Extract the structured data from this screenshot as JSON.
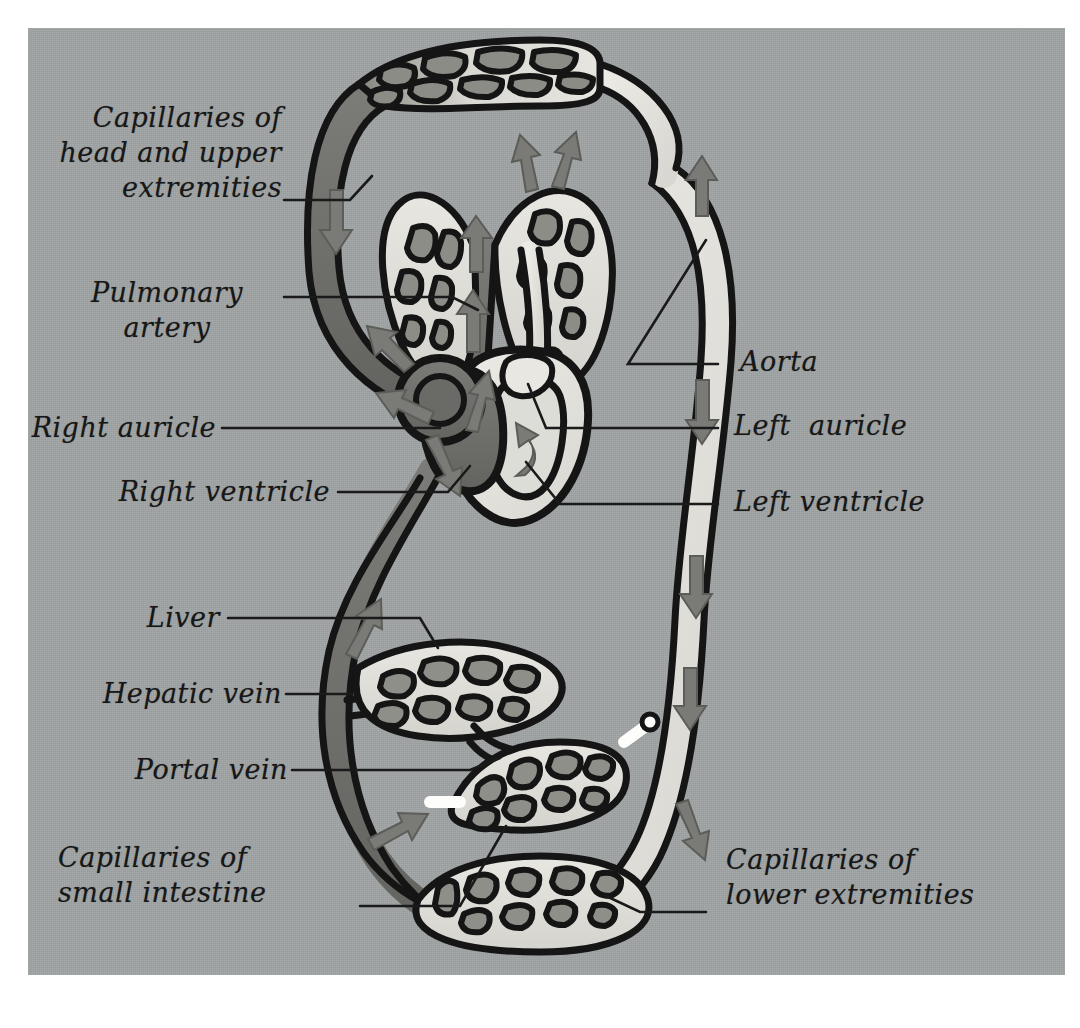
{
  "figure": {
    "background_color": "#9fa3a4",
    "border_color": "#ffffff",
    "ink_color": "#171717",
    "oxygenated_color": "#e3e2dd",
    "deoxygenated_color": "#6e6f6c",
    "arrow_color": "#7a7b77"
  },
  "labels": {
    "capillaries_head": "Capillaries of\nhead and upper\nextremities",
    "pulmonary_artery": "Pulmonary\nartery",
    "right_auricle": "Right auricle",
    "right_ventricle": "Right ventricle",
    "liver": "Liver",
    "hepatic_vein": "Hepatic vein",
    "portal_vein": "Portal vein",
    "capillaries_small_intestine": "Capillaries of\nsmall intestine",
    "aorta": "Aorta",
    "left_auricle": "Left  auricle",
    "left_ventricle": "Left ventricle",
    "capillaries_lower": "Capillaries of\nlower extremities"
  },
  "structures": [
    {
      "name": "capillaries-head-upper-extremities",
      "type": "capillary-bed",
      "blood": "mixed"
    },
    {
      "name": "right-lung",
      "type": "capillary-bed",
      "blood": "oxygenating"
    },
    {
      "name": "left-lung",
      "type": "capillary-bed",
      "blood": "oxygenating"
    },
    {
      "name": "pulmonary-artery",
      "type": "vessel",
      "blood": "deoxygenated"
    },
    {
      "name": "pulmonary-vein",
      "type": "vessel",
      "blood": "oxygenated"
    },
    {
      "name": "right-auricle",
      "type": "heart-chamber",
      "blood": "deoxygenated"
    },
    {
      "name": "right-ventricle",
      "type": "heart-chamber",
      "blood": "deoxygenated"
    },
    {
      "name": "left-auricle",
      "type": "heart-chamber",
      "blood": "oxygenated"
    },
    {
      "name": "left-ventricle",
      "type": "heart-chamber",
      "blood": "oxygenated"
    },
    {
      "name": "aorta",
      "type": "vessel",
      "blood": "oxygenated"
    },
    {
      "name": "superior-vena-cava",
      "type": "vessel",
      "blood": "deoxygenated"
    },
    {
      "name": "inferior-vena-cava",
      "type": "vessel",
      "blood": "deoxygenated"
    },
    {
      "name": "liver",
      "type": "capillary-bed",
      "blood": "deoxygenated"
    },
    {
      "name": "hepatic-vein",
      "type": "vessel",
      "blood": "deoxygenated"
    },
    {
      "name": "portal-vein",
      "type": "vessel",
      "blood": "deoxygenated"
    },
    {
      "name": "capillaries-small-intestine",
      "type": "capillary-bed",
      "blood": "deoxygenated"
    },
    {
      "name": "capillaries-lower-extremities",
      "type": "capillary-bed",
      "blood": "mixed"
    }
  ]
}
